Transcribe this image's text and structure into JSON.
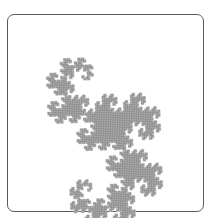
{
  "figure": {
    "type": "fractal",
    "iterations": 12,
    "start_point": [
      88,
      189
    ],
    "end_point": [
      84,
      76
    ],
    "bulk_side": "right",
    "stroke_color": "#8c8c8c",
    "fill_color": "#c4c4c4",
    "stroke_width": 0.9,
    "frame_color": "#5a5a5a",
    "background": "#ffffff"
  }
}
